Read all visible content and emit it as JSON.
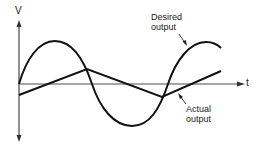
{
  "diagram": {
    "type": "waveform-comparison",
    "axes": {
      "y_label": "V",
      "x_label": "t"
    },
    "curves": [
      {
        "id": "desired",
        "name": "Desired output",
        "shape": "sine",
        "color": "#111111"
      },
      {
        "id": "actual",
        "name": "Actual output",
        "shape": "triangle",
        "color": "#111111"
      }
    ],
    "labels": {
      "desired_line1": "Desired",
      "desired_line2": "output",
      "actual_line1": "Actual",
      "actual_line2": "output"
    },
    "colors": {
      "axis": "#555555",
      "curve": "#111111",
      "background": "#ffffff"
    }
  }
}
